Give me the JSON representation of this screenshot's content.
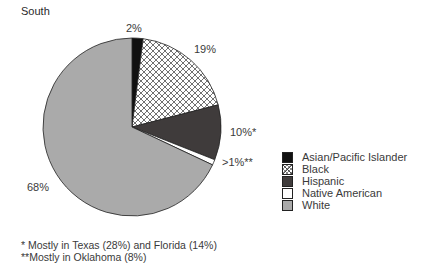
{
  "chart_data": {
    "type": "pie",
    "title": "South",
    "categories": [
      "Asian/Pacific Islander",
      "Black",
      "Hispanic",
      "Native American",
      "White"
    ],
    "values": [
      2,
      19,
      10,
      1,
      68
    ],
    "data_labels": [
      "2%",
      "19%",
      "10%*",
      ">1%**",
      "68%"
    ],
    "colors": [
      "#111111",
      "#ffffff",
      "#3f3b3b",
      "#ffffff",
      "#aaaaaa"
    ],
    "patterns": [
      "solid",
      "crosshatch",
      "solid",
      "solid",
      "solid"
    ],
    "legend_position": "right",
    "annotations": [
      "* Mostly in Texas (28%) and Florida (14%)",
      "**Mostly in Oklahoma (8%)"
    ]
  },
  "title": "South",
  "labels": {
    "asian": "2%",
    "black": "19%",
    "hispanic": "10%*",
    "native": ">1%**",
    "white": "68%"
  },
  "legend": [
    {
      "label": "Asian/Pacific Islander",
      "color": "#111111"
    },
    {
      "label": "Black",
      "color": "#ffffff"
    },
    {
      "label": "Hispanic",
      "color": "#3f3b3b"
    },
    {
      "label": "Native American",
      "color": "#ffffff"
    },
    {
      "label": "White",
      "color": "#aaaaaa"
    }
  ],
  "notes": {
    "note1": "* Mostly in Texas (28%) and Florida (14%)",
    "note2": "**Mostly in Oklahoma (8%)"
  }
}
